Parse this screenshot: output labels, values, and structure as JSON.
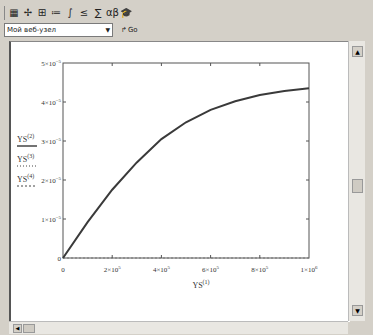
{
  "toolbar": {
    "icons": [
      "calculator-icon",
      "graph-icon",
      "matrix-icon",
      "evaluation-icon",
      "calculus-icon",
      "boolean-icon",
      "programming-icon",
      "greek-icon",
      "symbolic-icon"
    ],
    "glyphs": [
      "▦",
      "✢",
      "⊞",
      "≔",
      "∫",
      "≤",
      "∑",
      "αβ",
      "🎓"
    ]
  },
  "address_bar": {
    "selected": "Мой веб-узел",
    "go_label": "Go"
  },
  "scrollbars": {
    "vertical_position": 0.45,
    "horizontal_position": 0.0
  },
  "chart_data": {
    "type": "line",
    "title": "",
    "xlabel": "YS",
    "xlabel_sup": "(1)",
    "ylabel_entries": [
      {
        "name": "YS",
        "sup": "(2)",
        "style": "solid"
      },
      {
        "name": "YS",
        "sup": "(3)",
        "style": "dotted"
      },
      {
        "name": "YS",
        "sup": "(4)",
        "style": "dashed"
      }
    ],
    "xlim": [
      0,
      1000000
    ],
    "ylim": [
      0,
      5e-05
    ],
    "x_ticks": [
      {
        "value": 0,
        "label": "0"
      },
      {
        "value": 200000,
        "label": "2×10",
        "exp": "5"
      },
      {
        "value": 400000,
        "label": "4×10",
        "exp": "5"
      },
      {
        "value": 600000,
        "label": "6×10",
        "exp": "5"
      },
      {
        "value": 800000,
        "label": "8×10",
        "exp": "5"
      },
      {
        "value": 1000000,
        "label": "1×10",
        "exp": "6"
      }
    ],
    "y_ticks": [
      {
        "value": 0,
        "label": "0"
      },
      {
        "value": 1e-05,
        "label": "1×10",
        "exp": "−5"
      },
      {
        "value": 2e-05,
        "label": "2×10",
        "exp": "−5"
      },
      {
        "value": 3e-05,
        "label": "3×10",
        "exp": "−5"
      },
      {
        "value": 4e-05,
        "label": "4×10",
        "exp": "−5"
      },
      {
        "value": 5e-05,
        "label": "5×10",
        "exp": "−5"
      }
    ],
    "series": [
      {
        "name": "YS(2)",
        "color": "#3a3a3a",
        "x": [
          0,
          100000,
          200000,
          300000,
          400000,
          500000,
          600000,
          700000,
          800000,
          900000,
          1000000
        ],
        "y": [
          0,
          9.2e-06,
          1.75e-05,
          2.45e-05,
          3.05e-05,
          3.48e-05,
          3.8e-05,
          4.02e-05,
          4.18e-05,
          4.28e-05,
          4.35e-05
        ]
      }
    ],
    "grid": false
  }
}
